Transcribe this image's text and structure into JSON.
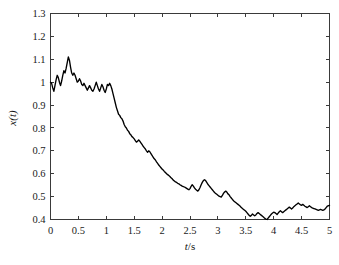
{
  "chart_data": {
    "type": "line",
    "title": "",
    "subtitle": "",
    "xlabel": "t/s",
    "xlabel_symbol": "t",
    "xlabel_unit": "/s",
    "ylabel": "x(t)",
    "ylabel_symbol": "x",
    "ylabel_arg": "(t)",
    "xlim": [
      0,
      5
    ],
    "ylim": [
      0.4,
      1.3
    ],
    "xticks": [
      0,
      0.5,
      1,
      1.5,
      2,
      2.5,
      3,
      3.5,
      4,
      4.5,
      5
    ],
    "xtick_labels": [
      "0",
      "0.5",
      "1",
      "1.5",
      "2",
      "2.5",
      "3",
      "3.5",
      "4",
      "4.5",
      "5"
    ],
    "yticks": [
      0.4,
      0.5,
      0.6,
      0.7,
      0.8,
      0.9,
      1.0,
      1.1,
      1.2,
      1.3
    ],
    "ytick_labels": [
      "0.4",
      "0.5",
      "0.6",
      "0.7",
      "0.8",
      "0.9",
      "1",
      "1.1",
      "1.2",
      "1.3"
    ],
    "grid": false,
    "legend": null,
    "legend_position": "none",
    "line_color": "#000000",
    "line_width": 1.35,
    "axis_color": "#3a3a3a",
    "background_color": "#ffffff",
    "series": [
      {
        "name": "x(t)",
        "x": [
          0.0,
          0.02,
          0.04,
          0.06,
          0.08,
          0.1,
          0.12,
          0.14,
          0.16,
          0.18,
          0.2,
          0.22,
          0.24,
          0.26,
          0.28,
          0.3,
          0.32,
          0.34,
          0.36,
          0.38,
          0.4,
          0.42,
          0.44,
          0.46,
          0.48,
          0.5,
          0.52,
          0.54,
          0.56,
          0.58,
          0.6,
          0.62,
          0.64,
          0.66,
          0.68,
          0.7,
          0.72,
          0.74,
          0.76,
          0.78,
          0.8,
          0.82,
          0.84,
          0.86,
          0.88,
          0.9,
          0.92,
          0.94,
          0.96,
          0.98,
          1.0,
          1.02,
          1.04,
          1.06,
          1.08,
          1.1,
          1.12,
          1.14,
          1.16,
          1.18,
          1.2,
          1.22,
          1.24,
          1.26,
          1.28,
          1.3,
          1.32,
          1.34,
          1.36,
          1.38,
          1.4,
          1.42,
          1.44,
          1.46,
          1.48,
          1.5,
          1.52,
          1.54,
          1.56,
          1.58,
          1.6,
          1.62,
          1.64,
          1.66,
          1.68,
          1.7,
          1.72,
          1.74,
          1.76,
          1.78,
          1.8,
          1.82,
          1.84,
          1.86,
          1.88,
          1.9,
          1.92,
          1.94,
          1.96,
          1.98,
          2.0,
          2.02,
          2.04,
          2.06,
          2.08,
          2.1,
          2.12,
          2.14,
          2.16,
          2.18,
          2.2,
          2.22,
          2.24,
          2.26,
          2.28,
          2.3,
          2.32,
          2.34,
          2.36,
          2.38,
          2.4,
          2.42,
          2.44,
          2.46,
          2.48,
          2.5,
          2.52,
          2.54,
          2.56,
          2.58,
          2.6,
          2.62,
          2.64,
          2.66,
          2.68,
          2.7,
          2.72,
          2.74,
          2.76,
          2.78,
          2.8,
          2.82,
          2.84,
          2.86,
          2.88,
          2.9,
          2.92,
          2.94,
          2.96,
          2.98,
          3.0,
          3.02,
          3.04,
          3.06,
          3.08,
          3.1,
          3.12,
          3.14,
          3.16,
          3.18,
          3.2,
          3.22,
          3.24,
          3.26,
          3.28,
          3.3,
          3.32,
          3.34,
          3.36,
          3.38,
          3.4,
          3.42,
          3.44,
          3.46,
          3.48,
          3.5,
          3.52,
          3.54,
          3.56,
          3.58,
          3.6,
          3.62,
          3.64,
          3.66,
          3.68,
          3.7,
          3.72,
          3.74,
          3.76,
          3.78,
          3.8,
          3.82,
          3.84,
          3.86,
          3.88,
          3.9,
          3.92,
          3.94,
          3.96,
          3.98,
          4.0,
          4.02,
          4.04,
          4.06,
          4.08,
          4.1,
          4.12,
          4.14,
          4.16,
          4.18,
          4.2,
          4.22,
          4.24,
          4.26,
          4.28,
          4.3,
          4.32,
          4.34,
          4.36,
          4.38,
          4.4,
          4.42,
          4.44,
          4.46,
          4.48,
          4.5,
          4.52,
          4.54,
          4.56,
          4.58,
          4.6,
          4.62,
          4.64,
          4.66,
          4.68,
          4.7,
          4.72,
          4.74,
          4.76,
          4.78,
          4.8,
          4.82,
          4.84,
          4.86,
          4.88,
          4.9,
          4.92,
          4.94,
          4.96,
          5.0
        ],
        "y": [
          1.0,
          0.995,
          0.975,
          0.96,
          0.985,
          1.01,
          1.03,
          1.02,
          1.0,
          0.985,
          1.005,
          1.03,
          1.05,
          1.04,
          1.06,
          1.085,
          1.11,
          1.095,
          1.065,
          1.04,
          1.03,
          1.04,
          1.03,
          1.015,
          1.0,
          1.005,
          1.015,
          1.005,
          0.99,
          0.985,
          0.995,
          0.985,
          0.975,
          0.965,
          0.975,
          0.985,
          0.975,
          0.965,
          0.96,
          0.97,
          0.985,
          1.0,
          0.985,
          0.97,
          0.96,
          0.975,
          0.99,
          0.98,
          0.965,
          0.955,
          0.97,
          0.99,
          0.985,
          0.995,
          0.985,
          0.97,
          0.95,
          0.93,
          0.91,
          0.89,
          0.875,
          0.86,
          0.855,
          0.845,
          0.84,
          0.83,
          0.815,
          0.805,
          0.8,
          0.79,
          0.785,
          0.775,
          0.77,
          0.762,
          0.758,
          0.752,
          0.745,
          0.738,
          0.742,
          0.748,
          0.742,
          0.735,
          0.728,
          0.72,
          0.714,
          0.708,
          0.7,
          0.694,
          0.7,
          0.696,
          0.688,
          0.68,
          0.672,
          0.665,
          0.66,
          0.652,
          0.645,
          0.638,
          0.632,
          0.626,
          0.62,
          0.616,
          0.61,
          0.605,
          0.6,
          0.596,
          0.592,
          0.588,
          0.582,
          0.578,
          0.572,
          0.568,
          0.564,
          0.562,
          0.558,
          0.556,
          0.552,
          0.549,
          0.546,
          0.544,
          0.542,
          0.539,
          0.536,
          0.533,
          0.53,
          0.535,
          0.545,
          0.552,
          0.546,
          0.538,
          0.532,
          0.528,
          0.524,
          0.53,
          0.54,
          0.552,
          0.562,
          0.57,
          0.574,
          0.57,
          0.562,
          0.554,
          0.548,
          0.542,
          0.536,
          0.53,
          0.524,
          0.518,
          0.514,
          0.51,
          0.506,
          0.502,
          0.5,
          0.498,
          0.505,
          0.514,
          0.52,
          0.524,
          0.52,
          0.512,
          0.508,
          0.5,
          0.494,
          0.488,
          0.482,
          0.478,
          0.474,
          0.47,
          0.466,
          0.462,
          0.458,
          0.452,
          0.448,
          0.444,
          0.44,
          0.436,
          0.43,
          0.424,
          0.418,
          0.414,
          0.418,
          0.424,
          0.42,
          0.416,
          0.42,
          0.426,
          0.43,
          0.426,
          0.422,
          0.418,
          0.414,
          0.41,
          0.405,
          0.402,
          0.4,
          0.406,
          0.412,
          0.418,
          0.424,
          0.428,
          0.432,
          0.43,
          0.426,
          0.422,
          0.428,
          0.434,
          0.438,
          0.434,
          0.43,
          0.434,
          0.438,
          0.442,
          0.446,
          0.45,
          0.454,
          0.45,
          0.446,
          0.45,
          0.456,
          0.46,
          0.464,
          0.468,
          0.472,
          0.468,
          0.464,
          0.462,
          0.466,
          0.462,
          0.458,
          0.455,
          0.452,
          0.456,
          0.46,
          0.456,
          0.452,
          0.45,
          0.448,
          0.446,
          0.444,
          0.442,
          0.44,
          0.442,
          0.444,
          0.442,
          0.44,
          0.442,
          0.446,
          0.452,
          0.458,
          0.462
        ],
        "notes": {
          "start_value": 1.0,
          "peak_value": 1.11,
          "peak_time": 0.32,
          "min_value": 0.4,
          "min_time": 3.88,
          "end_value": 0.462,
          "description": "noisy decaying signal"
        }
      }
    ]
  }
}
